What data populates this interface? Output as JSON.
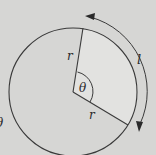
{
  "diagram": {
    "colors": {
      "background": "#d6d6d4",
      "sector_fill": "#e2e2e0",
      "stroke": "#3a3a3a"
    },
    "labels": {
      "radius_upper": "r",
      "radius_lower": "r",
      "angle": "θ",
      "arc_length": "l",
      "left_partial": "θ"
    },
    "geometry": {
      "center": [
        73,
        92
      ],
      "radius": 64,
      "upper_radius_end": [
        83,
        28
      ],
      "lower_radius_end": [
        128,
        125
      ]
    }
  }
}
